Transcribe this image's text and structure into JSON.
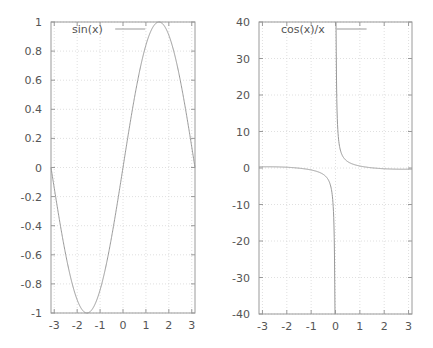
{
  "chart_data": [
    {
      "type": "line",
      "title": "",
      "xlabel": "",
      "ylabel": "",
      "xlim": [
        -3.14159,
        3.14159
      ],
      "ylim": [
        -1,
        1
      ],
      "grid": true,
      "legend_position": "top-left",
      "x_ticks": [
        "-3",
        "-2",
        "-1",
        "0",
        "1",
        "2",
        "3"
      ],
      "y_ticks": [
        "1",
        "0.8",
        "0.6",
        "0.4",
        "0.2",
        "0",
        "-0.2",
        "-0.4",
        "-0.6",
        "-0.8",
        "-1"
      ],
      "series": [
        {
          "name": "sin(x)",
          "function": "sin(x)",
          "color": "#999999",
          "x": [
            -3.14,
            -3,
            -2.5,
            -2,
            -1.57,
            -1,
            -0.5,
            0,
            0.5,
            1,
            1.57,
            2,
            2.5,
            3,
            3.14
          ],
          "y": [
            0,
            -0.14,
            -0.6,
            -0.91,
            -1,
            -0.84,
            -0.48,
            0,
            0.48,
            0.84,
            1,
            0.91,
            0.6,
            0.14,
            0
          ]
        }
      ]
    },
    {
      "type": "line",
      "title": "",
      "xlabel": "",
      "ylabel": "",
      "xlim": [
        -3.14159,
        3.14159
      ],
      "ylim": [
        -40,
        40
      ],
      "grid": true,
      "legend_position": "top-left",
      "x_ticks": [
        "-3",
        "-2",
        "-1",
        "0",
        "1",
        "2",
        "3"
      ],
      "y_ticks": [
        "40",
        "30",
        "20",
        "10",
        "0",
        "-10",
        "-20",
        "-30",
        "-40"
      ],
      "series": [
        {
          "name": "cos(x)/x",
          "function": "cos(x)/x",
          "color": "#999999",
          "x": [
            -3.14,
            -3,
            -2,
            -1,
            -0.5,
            -0.2,
            -0.1,
            -0.032,
            0.032,
            0.1,
            0.2,
            0.5,
            1,
            2,
            3,
            3.14
          ],
          "y": [
            0.32,
            0.33,
            0.21,
            -0.54,
            -1.76,
            -4.9,
            -9.95,
            -31.2,
            31.2,
            9.95,
            4.9,
            1.76,
            0.54,
            -0.21,
            -0.33,
            -0.32
          ]
        }
      ]
    }
  ],
  "plots": {
    "left": {
      "legend": "sin(x)"
    },
    "right": {
      "legend": "cos(x)/x"
    }
  }
}
